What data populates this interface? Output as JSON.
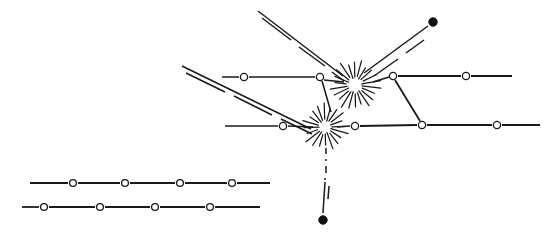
{
  "figure": {
    "title": "",
    "background_color": "#ffffff",
    "ink_color": "#1a1a1a",
    "width": 552,
    "height": 235
  },
  "chart_data": {
    "type": "diagram",
    "title": "",
    "xlabel": "",
    "ylabel": "",
    "grid": false,
    "legend": "none",
    "xlim": [
      0,
      552
    ],
    "ylim": [
      0,
      235
    ],
    "nodes": [
      {
        "id": "n1",
        "type": "open-circle",
        "x": 73,
        "y": 183,
        "r": 3.4,
        "label": ""
      },
      {
        "id": "n2",
        "type": "open-circle",
        "x": 125,
        "y": 183,
        "r": 3.4,
        "label": ""
      },
      {
        "id": "n3",
        "type": "open-circle",
        "x": 180,
        "y": 183,
        "r": 3.4,
        "label": ""
      },
      {
        "id": "n4",
        "type": "open-circle",
        "x": 232,
        "y": 183,
        "r": 3.4,
        "label": ""
      },
      {
        "id": "n5",
        "type": "open-circle",
        "x": 44,
        "y": 207,
        "r": 3.4,
        "label": ""
      },
      {
        "id": "n6",
        "type": "open-circle",
        "x": 100,
        "y": 207,
        "r": 3.4,
        "label": ""
      },
      {
        "id": "n7",
        "type": "open-circle",
        "x": 155,
        "y": 207,
        "r": 3.4,
        "label": ""
      },
      {
        "id": "n8",
        "type": "open-circle",
        "x": 210,
        "y": 207,
        "r": 3.4,
        "label": ""
      },
      {
        "id": "n9",
        "type": "open-circle",
        "x": 244,
        "y": 77,
        "r": 3.6,
        "label": ""
      },
      {
        "id": "n10",
        "type": "open-circle",
        "x": 320,
        "y": 77,
        "r": 3.6,
        "label": ""
      },
      {
        "id": "n11",
        "type": "open-circle",
        "x": 283,
        "y": 126,
        "r": 3.6,
        "label": ""
      },
      {
        "id": "n12",
        "type": "open-circle",
        "x": 355,
        "y": 126,
        "r": 3.6,
        "label": ""
      },
      {
        "id": "n13",
        "type": "open-circle",
        "x": 393,
        "y": 76,
        "r": 3.6,
        "label": ""
      },
      {
        "id": "n14",
        "type": "open-circle",
        "x": 466,
        "y": 76,
        "r": 3.6,
        "label": ""
      },
      {
        "id": "n15",
        "type": "open-circle",
        "x": 422,
        "y": 125,
        "r": 3.6,
        "label": ""
      },
      {
        "id": "n16",
        "type": "open-circle",
        "x": 497,
        "y": 125,
        "r": 3.6,
        "label": ""
      },
      {
        "id": "d1",
        "type": "filled-dot",
        "x": 433,
        "y": 22,
        "r": 4.2,
        "label": ""
      },
      {
        "id": "d2",
        "type": "filled-dot",
        "x": 323,
        "y": 220,
        "r": 4.2,
        "label": ""
      }
    ],
    "bursts": [
      {
        "id": "b1",
        "x": 355,
        "y": 85,
        "rays": 22,
        "inner_radius": 7,
        "outer_radius": 26,
        "label": "interaction-vertex-upper"
      },
      {
        "id": "b2",
        "x": 325,
        "y": 127,
        "rays": 20,
        "inner_radius": 6,
        "outer_radius": 24,
        "label": "interaction-vertex-lower"
      }
    ],
    "edges": [
      {
        "id": "e1",
        "from": "chainA-start",
        "to": "chainA-end",
        "style": "solid",
        "points": [
          [
            30,
            183
          ],
          [
            268,
            183
          ]
        ],
        "width": 1.7
      },
      {
        "id": "e2",
        "from": "chainB-start",
        "to": "chainB-end",
        "style": "solid",
        "points": [
          [
            22,
            207
          ],
          [
            258,
            207
          ]
        ],
        "width": 1.7
      },
      {
        "id": "e3",
        "from": "left-open",
        "to": "n9",
        "style": "solid",
        "points": [
          [
            222,
            77
          ],
          [
            320,
            77
          ]
        ],
        "width": 1.5
      },
      {
        "id": "e4",
        "from": "n10",
        "to": "b1",
        "style": "solid",
        "points": [
          [
            320,
            77
          ],
          [
            344,
            83
          ]
        ],
        "width": 1.5
      },
      {
        "id": "e5",
        "from": "mid-open",
        "to": "n11",
        "style": "solid",
        "points": [
          [
            225,
            126
          ],
          [
            283,
            126
          ]
        ],
        "width": 1.5
      },
      {
        "id": "e6",
        "from": "n11",
        "to": "b2",
        "style": "solid",
        "points": [
          [
            283,
            126
          ],
          [
            314,
            127
          ]
        ],
        "width": 1.5
      },
      {
        "id": "e7",
        "from": "b2",
        "to": "n12",
        "style": "solid",
        "points": [
          [
            336,
            127
          ],
          [
            355,
            126
          ]
        ],
        "width": 1.5
      },
      {
        "id": "e8",
        "from": "n12",
        "to": "n15",
        "style": "solid",
        "points": [
          [
            355,
            126
          ],
          [
            422,
            125
          ]
        ],
        "width": 1.7
      },
      {
        "id": "e9",
        "from": "n15",
        "to": "n16",
        "style": "solid",
        "points": [
          [
            422,
            125
          ],
          [
            497,
            125
          ]
        ],
        "width": 1.7
      },
      {
        "id": "e10",
        "from": "n16",
        "to": "right-end",
        "style": "solid",
        "points": [
          [
            497,
            125
          ],
          [
            540,
            125
          ]
        ],
        "width": 1.7
      },
      {
        "id": "e11",
        "from": "n13",
        "to": "n14",
        "style": "solid",
        "points": [
          [
            393,
            76
          ],
          [
            466,
            76
          ]
        ],
        "width": 1.7
      },
      {
        "id": "e12",
        "from": "n14",
        "to": "upper-end",
        "style": "solid",
        "points": [
          [
            466,
            76
          ],
          [
            512,
            76
          ]
        ],
        "width": 1.7
      },
      {
        "id": "e13",
        "from": "n13",
        "to": "n15",
        "style": "solid",
        "points": [
          [
            393,
            76
          ],
          [
            422,
            125
          ]
        ],
        "width": 1.7
      },
      {
        "id": "e14",
        "from": "b1",
        "to": "n13",
        "style": "solid",
        "points": [
          [
            372,
            82
          ],
          [
            393,
            76
          ]
        ],
        "width": 1.5
      },
      {
        "id": "e15",
        "from": "n10",
        "to": "b2",
        "style": "solid",
        "points": [
          [
            320,
            77
          ],
          [
            330,
            112
          ]
        ],
        "width": 1.5
      },
      {
        "id": "e16",
        "from": "b1-upright",
        "to": "d1",
        "style": "double",
        "points": [
          [
            365,
            72
          ],
          [
            428,
            26
          ]
        ],
        "width": 1.5
      },
      {
        "id": "e17",
        "from": "upper-left-A",
        "to": "b1",
        "style": "double",
        "points": [
          [
            258,
            12
          ],
          [
            344,
            78
          ]
        ],
        "width": 1.5
      },
      {
        "id": "e18",
        "from": "upper-left-B",
        "to": "b2",
        "style": "double",
        "points": [
          [
            182,
            66
          ],
          [
            312,
            130
          ]
        ],
        "width": 1.5
      },
      {
        "id": "e19",
        "from": "b2",
        "to": "d2",
        "style": "dash-dot-then-double",
        "points": [
          [
            326,
            150
          ],
          [
            323,
            214
          ]
        ],
        "width": 1.5
      }
    ]
  },
  "annotations": {
    "labels": []
  }
}
